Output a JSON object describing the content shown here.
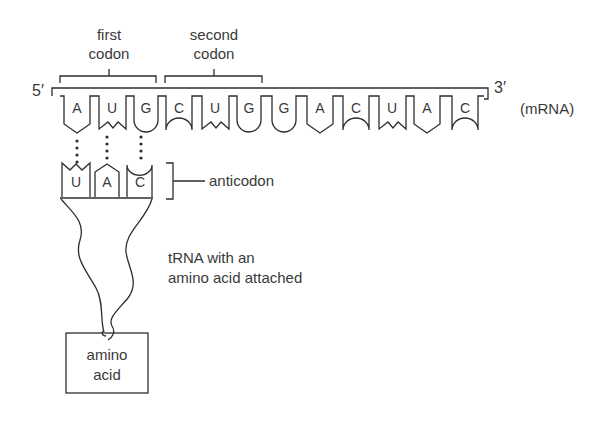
{
  "diagram": {
    "type": "tRNA-mRNA codon pairing",
    "labels": {
      "first_codon_line1": "first",
      "first_codon_line2": "codon",
      "second_codon_line1": "second",
      "second_codon_line2": "codon",
      "five_prime": "5′",
      "three_prime": "3′",
      "mrna": "(mRNA)",
      "anticodon": "anticodon",
      "trna_line1": "tRNA with an",
      "trna_line2": "amino acid attached",
      "amino_line1": "amino",
      "amino_line2": "acid"
    },
    "mrna_bases": [
      "A",
      "U",
      "G",
      "C",
      "U",
      "G",
      "G",
      "A",
      "C",
      "U",
      "A",
      "C"
    ],
    "anticodon_bases": [
      "U",
      "A",
      "C"
    ],
    "colors": {
      "line": "#2e2e2e",
      "text": "#3a3a3a",
      "background": "#ffffff"
    }
  }
}
